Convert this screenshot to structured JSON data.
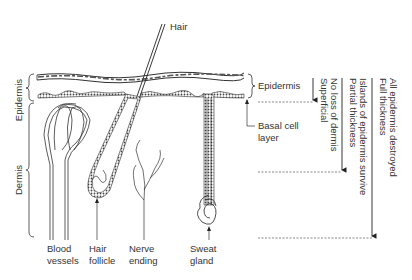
{
  "diagram": {
    "left_labels": {
      "epidermis": "Epidermis",
      "dermis": "Dermis"
    },
    "top_label": "Hair",
    "right_labels": {
      "epidermis": "Epidermis",
      "basal_line1": "Basal cell",
      "basal_line2": "layer"
    },
    "bottom_labels": [
      {
        "line1": "Blood",
        "line2": "vessels"
      },
      {
        "line1": "Hair",
        "line2": "follicle"
      },
      {
        "line1": "Nerve",
        "line2": "ending"
      },
      {
        "line1": "Sweat",
        "line2": "gland"
      }
    ],
    "burn_depths": [
      {
        "line1": "Superficial",
        "line2": "No loss of dermis"
      },
      {
        "line1": "Partial thickness",
        "line2": "Islands of epidermis survive"
      },
      {
        "line1": "Full thickness",
        "line2": "All epidermis destroyed"
      }
    ]
  }
}
